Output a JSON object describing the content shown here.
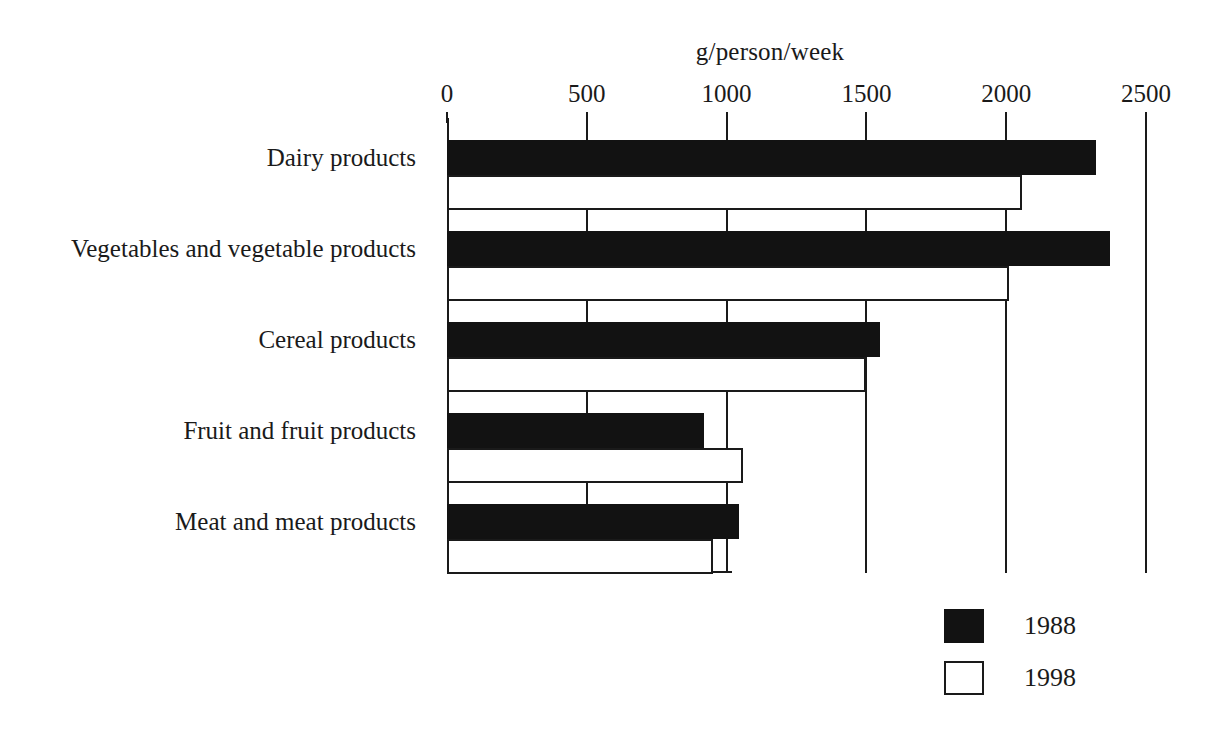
{
  "chart_data": {
    "type": "bar",
    "orientation": "horizontal",
    "title": "",
    "xlabel": "g/person/week",
    "ylabel": "",
    "xlim": [
      0,
      2500
    ],
    "xticks": [
      0,
      500,
      1000,
      1500,
      2000,
      2500
    ],
    "xtick_labels": [
      "0",
      "500",
      "1000",
      "1500",
      "2000",
      "2500"
    ],
    "grid": true,
    "grid_axis": "x",
    "legend_position": "bottom-right",
    "categories": [
      "Dairy products",
      "Vegetables and vegetable products",
      "Cereal products",
      "Fruit and fruit products",
      "Meat and meat products"
    ],
    "series": [
      {
        "name": "1988",
        "color": "#121212",
        "values": [
          2320,
          2370,
          1550,
          920,
          1045
        ]
      },
      {
        "name": "1998",
        "color": "#ffffff",
        "edgecolor": "#1a1a1a",
        "values": [
          2055,
          2010,
          1500,
          1060,
          950
        ]
      }
    ]
  },
  "axis": {
    "title": "g/person/week",
    "ticks": [
      "0",
      "500",
      "1000",
      "1500",
      "2000",
      "2500"
    ]
  },
  "legend": {
    "items": [
      {
        "label": "1988",
        "swatch": "filled-black-square"
      },
      {
        "label": "1998",
        "swatch": "outlined-white-square"
      }
    ]
  },
  "colors": {
    "series_1988": "#121212",
    "series_1998": "#ffffff",
    "axis": "#1a1a1a",
    "background": "#ffffff"
  }
}
